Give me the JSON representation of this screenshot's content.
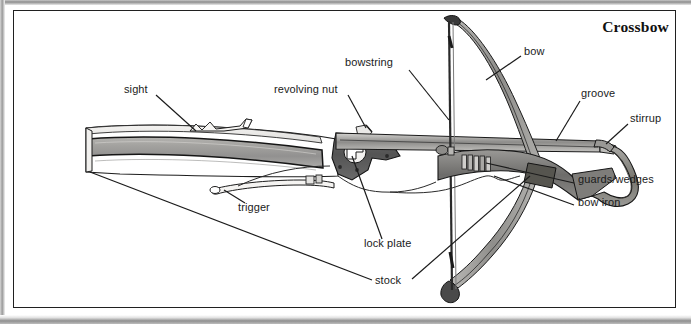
{
  "figure": {
    "title": "Crossbow",
    "subject": "crossbow",
    "style": "black-and-white scanned line drawing with labeled callouts"
  },
  "labels": [
    {
      "id": "sight",
      "text": "sight",
      "x": 124,
      "y": 90,
      "anchor": "start"
    },
    {
      "id": "revolving-nut",
      "text": "revolving nut",
      "x": 274,
      "y": 90,
      "anchor": "start"
    },
    {
      "id": "bowstring",
      "text": "bowstring",
      "x": 345,
      "y": 63,
      "anchor": "start"
    },
    {
      "id": "bow",
      "text": "bow",
      "x": 524,
      "y": 52,
      "anchor": "start"
    },
    {
      "id": "groove",
      "text": "groove",
      "x": 581,
      "y": 94,
      "anchor": "start"
    },
    {
      "id": "stirrup",
      "text": "stirrup",
      "x": 630,
      "y": 119,
      "anchor": "start"
    },
    {
      "id": "guards-wedges",
      "text": "guards/wedges",
      "x": 578,
      "y": 180,
      "anchor": "start"
    },
    {
      "id": "bow-iron",
      "text": "bow iron",
      "x": 578,
      "y": 203,
      "anchor": "start"
    },
    {
      "id": "trigger",
      "text": "trigger",
      "x": 238,
      "y": 208,
      "anchor": "start"
    },
    {
      "id": "lock-plate",
      "text": "lock plate",
      "x": 364,
      "y": 244,
      "anchor": "start"
    },
    {
      "id": "stock",
      "text": "stock",
      "x": 375,
      "y": 281,
      "anchor": "start"
    }
  ],
  "parts": [
    {
      "id": "stock",
      "name": "stock",
      "description": "long tapering wooden tiller running left to right"
    },
    {
      "id": "sight",
      "name": "sight",
      "description": "notched raised sight on top of the stock"
    },
    {
      "id": "lock-plate",
      "name": "lock plate",
      "description": "dark riveted metal plate holding the lock mechanism"
    },
    {
      "id": "revolving-nut",
      "name": "revolving nut",
      "description": "rotating nut that holds the drawn bowstring"
    },
    {
      "id": "trigger",
      "name": "trigger",
      "description": "long curved trigger lever beneath the stock"
    },
    {
      "id": "bow",
      "name": "bow",
      "description": "curved composite prod mounted across the front of the stock"
    },
    {
      "id": "bowstring",
      "name": "bowstring",
      "description": "string spanning the two bow tips, drawn back to the nut"
    },
    {
      "id": "groove",
      "name": "groove",
      "description": "bolt channel along the top surface of the stock"
    },
    {
      "id": "bow-iron",
      "name": "bow iron",
      "description": "iron fitting clamping the bow to the stock"
    },
    {
      "id": "guards-wedges",
      "name": "guards/wedges",
      "description": "wedges and guards securing the bow in the bow iron"
    },
    {
      "id": "stirrup",
      "name": "stirrup",
      "description": "forward iron loop for the foot when spanning the bow"
    }
  ],
  "colors": {
    "ink": "#1b1b1b",
    "paper": "#ffffff",
    "wood_light": "#e8e7e3",
    "wood_mid": "#9d9d9a",
    "wood_dark": "#6f6f6c",
    "metal_dark": "#4a4a4a",
    "metal_mid": "#858585"
  }
}
